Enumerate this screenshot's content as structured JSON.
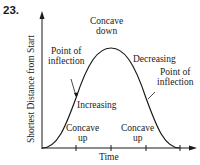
{
  "problem_number": "23.",
  "axes": {
    "x_label": "Time",
    "y_label": "Shortest Distance from Start"
  },
  "annotations": {
    "concave_down": [
      "Concave",
      "down"
    ],
    "point_of_inflection_left": [
      "Point of",
      "inflection"
    ],
    "point_of_inflection_right": [
      "Point of",
      "inflection"
    ],
    "increasing": "Increasing",
    "decreasing": "Decreasing",
    "concave_up_left": [
      "Concave",
      "up"
    ],
    "concave_up_right": [
      "Concave",
      "up"
    ]
  },
  "colors": {
    "line": "#1a1a1a",
    "background": "#ffffff"
  }
}
